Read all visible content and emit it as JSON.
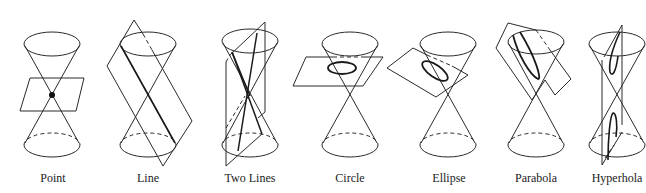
{
  "figure": {
    "panels": [
      {
        "id": "point",
        "label": "Point",
        "center_x": 52
      },
      {
        "id": "line",
        "label": "Line",
        "center_x": 148
      },
      {
        "id": "two-lines",
        "label": "Two Lines",
        "center_x": 250
      },
      {
        "id": "circle",
        "label": "Circle",
        "center_x": 350
      },
      {
        "id": "ellipse",
        "label": "Ellipse",
        "center_x": 448
      },
      {
        "id": "parabola",
        "label": "Parabola",
        "center_x": 536
      },
      {
        "id": "hyperbola",
        "label": "Hyperhola",
        "center_x": 617
      }
    ]
  },
  "colors": {
    "line": "#2a2a2a",
    "background": "#ffffff"
  }
}
